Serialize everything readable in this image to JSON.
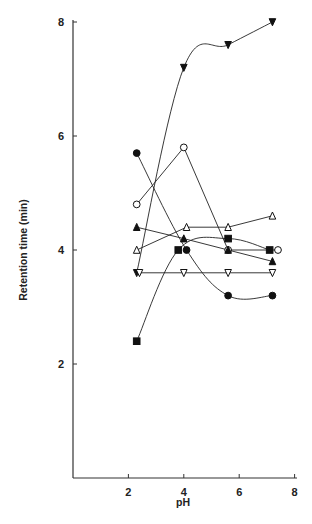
{
  "chart_data": {
    "type": "line",
    "title": "",
    "xlabel": "pH",
    "ylabel": "Retention time (min)",
    "xlim": [
      0,
      8.2
    ],
    "ylim": [
      0,
      8
    ],
    "x_ticks": [
      2,
      4,
      6,
      8
    ],
    "y_ticks": [
      2,
      4,
      6,
      8
    ],
    "grid": false,
    "legend": null,
    "series": [
      {
        "name": "filled-down-triangle",
        "marker": "filled_down_triangle",
        "x": [
          2.3,
          4.0,
          5.6,
          7.2
        ],
        "values": [
          3.6,
          7.2,
          7.6,
          8.0
        ]
      },
      {
        "name": "open-circle",
        "marker": "open_circle",
        "x": [
          2.3,
          4.0,
          5.6,
          7.4
        ],
        "values": [
          4.8,
          5.8,
          4.0,
          4.0
        ]
      },
      {
        "name": "filled-circle",
        "marker": "filled_circle",
        "x": [
          2.3,
          4.1,
          5.6,
          7.2
        ],
        "values": [
          5.7,
          4.0,
          3.2,
          3.2
        ]
      },
      {
        "name": "filled-triangle",
        "marker": "filled_triangle",
        "x": [
          2.3,
          4.0,
          5.6,
          7.2
        ],
        "values": [
          4.4,
          4.2,
          4.0,
          3.8
        ]
      },
      {
        "name": "open-triangle",
        "marker": "open_triangle",
        "x": [
          2.3,
          4.1,
          5.6,
          7.2
        ],
        "values": [
          4.0,
          4.4,
          4.4,
          4.6
        ]
      },
      {
        "name": "filled-square",
        "marker": "filled_square",
        "x": [
          2.3,
          3.8,
          5.6,
          7.1
        ],
        "values": [
          2.4,
          4.0,
          4.2,
          4.0
        ]
      },
      {
        "name": "open-down-triangle",
        "marker": "open_down_triangle",
        "x": [
          2.4,
          4.0,
          5.6,
          7.2
        ],
        "values": [
          3.6,
          3.6,
          3.6,
          3.6
        ]
      }
    ]
  }
}
